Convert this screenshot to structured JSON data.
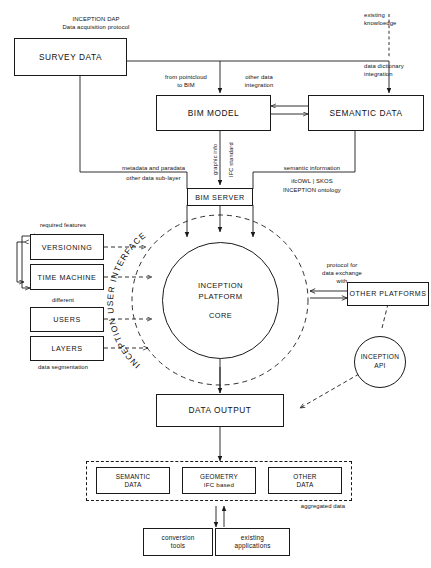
{
  "diagram": {
    "colors": {
      "stroke": "#1a1a1a",
      "text": "#111111",
      "background": "#ffffff"
    },
    "nodes": {
      "survey_data": {
        "label": "SURVEY DATA"
      },
      "bim_model": {
        "label": "BIM MODEL"
      },
      "semantic_data": {
        "label": "SEMANTIC DATA"
      },
      "bim_server": {
        "label": "BIM SERVER"
      },
      "versioning": {
        "label": "VERSIONING"
      },
      "time_machine": {
        "label": "TIME MACHINE"
      },
      "users": {
        "label": "USERS"
      },
      "layers": {
        "label": "LAYERS"
      },
      "core": {
        "title": "INCEPTION\nPLATFORM",
        "sub": "CORE"
      },
      "user_interface_ring": {
        "label": "INCEPTION USER INTERFACE"
      },
      "other_platforms": {
        "label": "OTHER PLATFORMS"
      },
      "inception_api": {
        "label": "INCEPTION\nAPI"
      },
      "data_output": {
        "label": "DATA OUTPUT"
      },
      "out_semantic_data": {
        "label": "SEMANTIC\nDATA"
      },
      "out_geometry": {
        "label": "GEOMETRY",
        "sub": "IFC based"
      },
      "out_other_data": {
        "label": "OTHER\nDATA"
      },
      "conversion_tools": {
        "label": "conversion\ntools"
      },
      "existing_applications": {
        "label": "existing\napplications"
      }
    },
    "annotations": {
      "inception_dap": "INCEPTION DAP\nData acquisition protocol",
      "existing_knowledge": "existing\nknowloedge",
      "data_dictionary_integration": "data dictionary\nintegration",
      "from_pointcloud_to_bim": "from pointcloud\nto BIM",
      "other_data_integration": "other data\nintegration",
      "graphic_info": "graphic info",
      "ifc_standard": "IFC standard",
      "metadata_and_paradata": "metadata and paradata",
      "other_data_sublayer": "other data sub-layer",
      "semantic_information": "semantic information",
      "ifcowl_skos": "ifcOWL | SKOS",
      "inception_ontology": "INCEPTION ontology",
      "required_features": "required features",
      "different": "different",
      "data_segmentation": "data segmentation",
      "protocol_for_data_exchange": "protocol for\ndata exchange\nwith",
      "aggregated_data": "aggregated data"
    }
  }
}
